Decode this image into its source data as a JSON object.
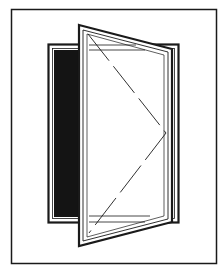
{
  "figure": {
    "colors": {
      "background": "#ffffff",
      "line": "#1a1a1a",
      "opening": "#141414"
    },
    "elements": [
      {
        "name": "outer-border"
      },
      {
        "name": "window-frame"
      },
      {
        "name": "dark-opening"
      },
      {
        "name": "open-sash"
      },
      {
        "name": "hinge-indicator-dashed-lines"
      }
    ]
  }
}
